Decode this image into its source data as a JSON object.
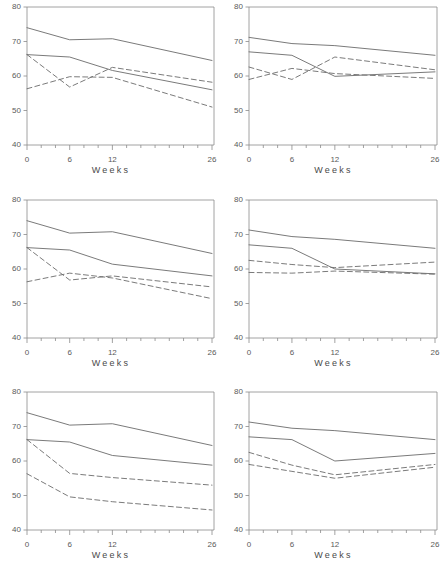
{
  "figure": {
    "layout": "2 columns x 3 rows of line charts",
    "panel_count": 6,
    "background": "#ffffff",
    "line_color": "#6b6b6b",
    "axis_color": "#8a8a8a",
    "text_color": "#5a5a5a"
  },
  "axes": {
    "xlabel": "Weeks",
    "xticks": [
      "0",
      "6",
      "12",
      "26"
    ],
    "xtick_values": [
      0,
      6,
      12,
      26
    ],
    "yticks": [
      "40",
      "50",
      "60",
      "70",
      "80"
    ],
    "ytick_values": [
      40,
      50,
      60,
      70,
      80
    ],
    "xlim": [
      0,
      26
    ],
    "ylim": [
      40,
      80
    ],
    "grid": false,
    "legend": "none"
  },
  "chart_data": [
    {
      "type": "line",
      "panel": 1,
      "position": "row-1-left",
      "title": "",
      "xlabel": "Weeks",
      "ylabel": "",
      "x": [
        0,
        6,
        12,
        26
      ],
      "xlim": [
        0,
        26
      ],
      "ylim": [
        40,
        80
      ],
      "grid": false,
      "series": [
        {
          "name": "series-1",
          "style": "solid",
          "values": [
            74.0,
            70.5,
            70.8,
            64.5
          ]
        },
        {
          "name": "series-2",
          "style": "solid",
          "values": [
            66.2,
            65.5,
            61.6,
            56.0
          ]
        },
        {
          "name": "series-3",
          "style": "dashed",
          "values": [
            66.2,
            56.8,
            62.5,
            58.2
          ]
        },
        {
          "name": "series-4",
          "style": "dashed",
          "values": [
            56.3,
            59.8,
            59.6,
            51.0
          ]
        }
      ]
    },
    {
      "type": "line",
      "panel": 2,
      "position": "row-1-right",
      "title": "",
      "xlabel": "Weeks",
      "ylabel": "",
      "x": [
        0,
        6,
        12,
        26
      ],
      "xlim": [
        0,
        26
      ],
      "ylim": [
        40,
        80
      ],
      "grid": false,
      "series": [
        {
          "name": "series-1",
          "style": "solid",
          "values": [
            71.2,
            69.4,
            68.8,
            66.0
          ]
        },
        {
          "name": "series-2",
          "style": "solid",
          "values": [
            67.0,
            66.0,
            59.9,
            61.2
          ]
        },
        {
          "name": "series-3",
          "style": "dashed",
          "values": [
            62.6,
            59.0,
            65.5,
            61.8
          ]
        },
        {
          "name": "series-4",
          "style": "dashed",
          "values": [
            59.0,
            62.2,
            60.7,
            59.3
          ]
        }
      ]
    },
    {
      "type": "line",
      "panel": 3,
      "position": "row-2-left",
      "title": "",
      "xlabel": "Weeks",
      "ylabel": "",
      "x": [
        0,
        6,
        12,
        26
      ],
      "xlim": [
        0,
        26
      ],
      "ylim": [
        40,
        80
      ],
      "grid": false,
      "series": [
        {
          "name": "series-1",
          "style": "solid",
          "values": [
            74.0,
            70.4,
            70.8,
            64.5
          ]
        },
        {
          "name": "series-2",
          "style": "solid",
          "values": [
            66.2,
            65.5,
            61.4,
            58.0
          ]
        },
        {
          "name": "series-3",
          "style": "dashed",
          "values": [
            66.2,
            56.8,
            58.0,
            54.8
          ]
        },
        {
          "name": "series-4",
          "style": "dashed",
          "values": [
            56.3,
            58.8,
            57.4,
            51.4
          ]
        }
      ]
    },
    {
      "type": "line",
      "panel": 4,
      "position": "row-2-right",
      "title": "",
      "xlabel": "Weeks",
      "ylabel": "",
      "x": [
        0,
        6,
        12,
        26
      ],
      "xlim": [
        0,
        26
      ],
      "ylim": [
        40,
        80
      ],
      "grid": false,
      "series": [
        {
          "name": "series-1",
          "style": "solid",
          "values": [
            71.3,
            69.4,
            68.6,
            66.0
          ]
        },
        {
          "name": "series-2",
          "style": "solid",
          "values": [
            67.0,
            66.0,
            60.0,
            58.6
          ]
        },
        {
          "name": "series-3",
          "style": "dashed",
          "values": [
            62.5,
            61.3,
            60.4,
            62.0
          ]
        },
        {
          "name": "series-4",
          "style": "dashed",
          "values": [
            59.0,
            58.8,
            59.4,
            58.5
          ]
        }
      ]
    },
    {
      "type": "line",
      "panel": 5,
      "position": "row-3-left",
      "title": "",
      "xlabel": "Weeks",
      "ylabel": "",
      "x": [
        0,
        6,
        12,
        26
      ],
      "xlim": [
        0,
        26
      ],
      "ylim": [
        40,
        80
      ],
      "grid": false,
      "series": [
        {
          "name": "series-1",
          "style": "solid",
          "values": [
            74.0,
            70.4,
            70.8,
            64.5
          ]
        },
        {
          "name": "series-2",
          "style": "solid",
          "values": [
            66.2,
            65.5,
            61.6,
            58.8
          ]
        },
        {
          "name": "series-3",
          "style": "dashed",
          "values": [
            66.2,
            56.4,
            55.2,
            53.0
          ]
        },
        {
          "name": "series-4",
          "style": "dashed",
          "values": [
            56.3,
            49.6,
            48.2,
            45.8
          ]
        }
      ]
    },
    {
      "type": "line",
      "panel": 6,
      "position": "row-3-right",
      "title": "",
      "xlabel": "Weeks",
      "ylabel": "",
      "x": [
        0,
        6,
        12,
        26
      ],
      "xlim": [
        0,
        26
      ],
      "ylim": [
        40,
        80
      ],
      "grid": false,
      "series": [
        {
          "name": "series-1",
          "style": "solid",
          "values": [
            71.3,
            69.5,
            68.8,
            66.2
          ]
        },
        {
          "name": "series-2",
          "style": "solid",
          "values": [
            67.0,
            66.2,
            60.0,
            62.2
          ]
        },
        {
          "name": "series-3",
          "style": "dashed",
          "values": [
            62.5,
            58.8,
            56.0,
            59.0
          ]
        },
        {
          "name": "series-4",
          "style": "dashed",
          "values": [
            59.0,
            57.0,
            55.0,
            58.2
          ]
        }
      ]
    }
  ]
}
